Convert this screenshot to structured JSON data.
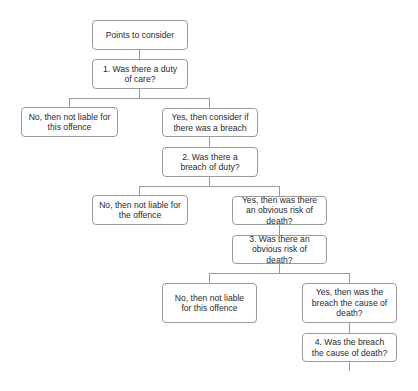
{
  "diagram": {
    "type": "decision-flowchart",
    "colors": {
      "border": "#9a9a9a",
      "connector": "#9a9a9a",
      "text": "#2a2a2a",
      "background": "#ffffff"
    },
    "nodes": {
      "start": {
        "label": "Points to consider"
      },
      "q1": {
        "label": "1. Was there a duty of care?"
      },
      "q1_no": {
        "label": "No, then not liable for this offence"
      },
      "q1_yes": {
        "label": "Yes, then consider if there was a breach"
      },
      "q2": {
        "label": "2. Was there a breach of duty?"
      },
      "q2_no": {
        "label": "No, then not liable for the offence"
      },
      "q2_yes": {
        "label": "Yes, then was there an obvious risk of death?"
      },
      "q3": {
        "label": "3. Was there an obvious risk of death?"
      },
      "q3_no": {
        "label": "No, then not liable for this offence"
      },
      "q3_yes": {
        "label": "Yes, then was the breach the cause of death?"
      },
      "q4": {
        "label": "4. Was the breach the cause of death?"
      }
    },
    "edges": [
      {
        "from": "start",
        "to": "q1"
      },
      {
        "from": "q1",
        "to": "q1_no"
      },
      {
        "from": "q1",
        "to": "q1_yes"
      },
      {
        "from": "q1_yes",
        "to": "q2"
      },
      {
        "from": "q2",
        "to": "q2_no"
      },
      {
        "from": "q2",
        "to": "q2_yes"
      },
      {
        "from": "q2_yes",
        "to": "q3"
      },
      {
        "from": "q3",
        "to": "q3_no"
      },
      {
        "from": "q3",
        "to": "q3_yes"
      },
      {
        "from": "q3_yes",
        "to": "q4"
      },
      {
        "from": "q4",
        "to": "continues-below"
      }
    ]
  }
}
